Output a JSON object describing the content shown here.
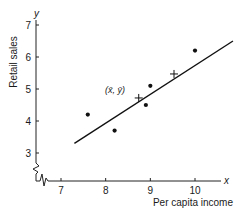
{
  "chart_data": {
    "type": "scatter",
    "title": "",
    "xlabel": "Per capita income",
    "ylabel": "Retail sales",
    "x_axis_letter": "x",
    "y_axis_letter": "y",
    "xlim": [
      6.45,
      10.95
    ],
    "ylim": [
      2.2,
      7.2
    ],
    "x_ticks": [
      7,
      8,
      9,
      10
    ],
    "y_ticks": [
      3,
      4,
      5,
      6,
      7
    ],
    "axis_breaks": [
      "x",
      "y"
    ],
    "grid": false,
    "legend": null,
    "points": [
      {
        "x": 7.6,
        "y": 4.2
      },
      {
        "x": 8.2,
        "y": 3.7
      },
      {
        "x": 8.9,
        "y": 4.5
      },
      {
        "x": 9.0,
        "y": 5.1
      },
      {
        "x": 10.0,
        "y": 6.2
      }
    ],
    "regression_line": {
      "x0": 7.3,
      "y0": 3.3,
      "x1": 10.85,
      "y1": 6.5
    },
    "markers": [
      {
        "label": "(x̄, ȳ)",
        "x": 8.74,
        "y": 4.72,
        "symbol": "cross"
      },
      {
        "label": "",
        "x": 9.53,
        "y": 5.47,
        "symbol": "cross"
      }
    ],
    "annotations": [
      {
        "text": "(x̄, ȳ)",
        "x": 8.74,
        "y": 4.72
      }
    ]
  },
  "labels": {
    "xlabel": "Per capita income",
    "ylabel": "Retail sales",
    "x_letter": "x",
    "y_letter": "y",
    "mean_label": "(x̄, ȳ)"
  }
}
